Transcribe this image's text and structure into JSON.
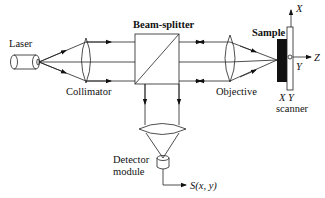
{
  "diagram": {
    "title": "",
    "labels": {
      "laser": "Laser",
      "collimator": "Collimator",
      "beam_splitter": "Beam-splitter",
      "objective": "Objective",
      "sample": "Sample",
      "axis_x": "X",
      "axis_y": "Y",
      "axis_z": "Z",
      "scanner_line1": "X Y",
      "scanner_line2": "scanner",
      "detector_line1": "Detector",
      "detector_line2": "module",
      "signal": "S(x, y)"
    },
    "components": [
      {
        "id": "laser",
        "icon": "cylinder-laser-icon"
      },
      {
        "id": "collimator",
        "icon": "convex-lens-icon"
      },
      {
        "id": "beam-splitter",
        "icon": "cube-beam-splitter-icon"
      },
      {
        "id": "objective",
        "icon": "convex-lens-icon"
      },
      {
        "id": "sample",
        "icon": "black-slab-icon"
      },
      {
        "id": "xy-scanner",
        "icon": "plate-icon"
      },
      {
        "id": "detector-lens",
        "icon": "convex-lens-icon"
      },
      {
        "id": "detector-module",
        "icon": "cylinder-detector-icon"
      }
    ],
    "colors": {
      "line": "#222222",
      "sample_fill": "#111111",
      "background": "#ffffff"
    }
  }
}
